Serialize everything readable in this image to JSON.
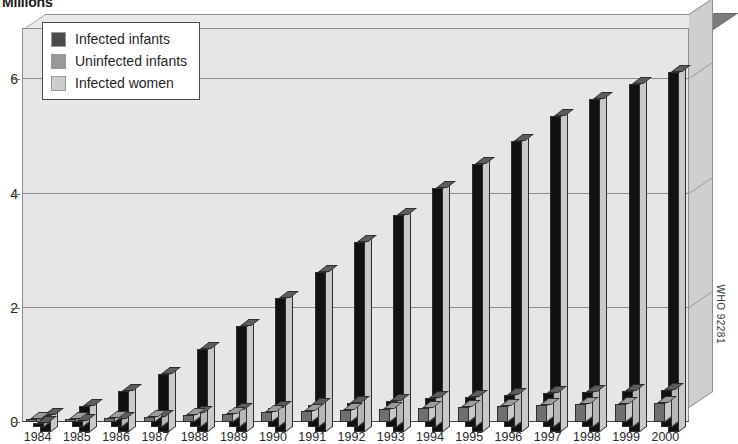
{
  "title": "Millions",
  "credit": "WHO 92281",
  "legend": {
    "items": [
      {
        "label": "Infected infants",
        "color": "#4a4a4a"
      },
      {
        "label": "Uninfected infants",
        "color": "#999999"
      },
      {
        "label": "Infected women",
        "color": "#cccccc"
      }
    ]
  },
  "axis": {
    "y_ticks": [
      "0",
      "2",
      "4",
      "6"
    ],
    "x_ticks": [
      "1984",
      "1985",
      "1986",
      "1987",
      "1988",
      "1989",
      "1990",
      "1991",
      "1992",
      "1993",
      "1994",
      "1995",
      "1996",
      "1997",
      "1998",
      "1999",
      "2000"
    ]
  },
  "chart_data": {
    "type": "bar",
    "title": "Millions",
    "xlabel": "",
    "ylabel": "Millions",
    "ylim": [
      0,
      6.9
    ],
    "yticks": [
      0,
      2,
      4,
      6
    ],
    "grid": true,
    "legend_position": "top-left",
    "style": "3d-grouped-column",
    "categories": [
      "1984",
      "1985",
      "1986",
      "1987",
      "1988",
      "1989",
      "1990",
      "1991",
      "1992",
      "1993",
      "1994",
      "1995",
      "1996",
      "1997",
      "1998",
      "1999",
      "2000"
    ],
    "series": [
      {
        "name": "Infected women",
        "color": "#cccccc",
        "values": [
          0.3,
          0.46,
          0.72,
          1.01,
          1.45,
          1.86,
          2.35,
          2.8,
          3.33,
          3.8,
          4.27,
          4.7,
          5.09,
          5.54,
          5.84,
          6.1,
          6.3
        ]
      },
      {
        "name": "Uninfected infants",
        "color": "#999999",
        "values": [
          0.07,
          0.1,
          0.14,
          0.18,
          0.24,
          0.29,
          0.33,
          0.38,
          0.42,
          0.46,
          0.5,
          0.53,
          0.56,
          0.59,
          0.61,
          0.63,
          0.65
        ]
      },
      {
        "name": "Infected infants",
        "color": "#4a4a4a",
        "values": [
          0.03,
          0.05,
          0.07,
          0.09,
          0.12,
          0.14,
          0.17,
          0.19,
          0.21,
          0.23,
          0.25,
          0.27,
          0.28,
          0.3,
          0.31,
          0.32,
          0.33
        ]
      }
    ]
  }
}
